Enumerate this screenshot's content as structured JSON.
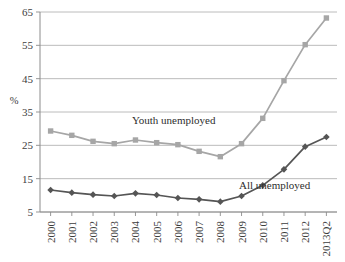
{
  "chart_data": {
    "type": "line",
    "title": "",
    "xlabel": "",
    "ylabel": "%",
    "ylim": [
      5,
      65
    ],
    "yticks": [
      5,
      15,
      25,
      35,
      45,
      55,
      65
    ],
    "grid": true,
    "legend_position": "inline-annotations",
    "categories": [
      "2000",
      "2001",
      "2002",
      "2003",
      "2004",
      "2005",
      "2006",
      "2007",
      "2008",
      "2009",
      "2010",
      "2011",
      "2012",
      "2013Q2"
    ],
    "series": [
      {
        "name": "Youth unemployed",
        "color": "#a6a6a6",
        "marker": "square",
        "values": [
          29.3,
          28.0,
          26.2,
          25.5,
          26.6,
          25.8,
          25.2,
          23.2,
          21.6,
          25.5,
          33.1,
          44.4,
          55.2,
          63.2
        ]
      },
      {
        "name": "All unemployed",
        "color": "#555555",
        "marker": "diamond",
        "values": [
          11.6,
          10.8,
          10.2,
          9.8,
          10.6,
          10.1,
          9.2,
          8.8,
          8.1,
          9.8,
          13.0,
          17.8,
          24.6,
          27.5
        ]
      }
    ],
    "annotations": [
      {
        "text": "Youth unemployed",
        "x_frac": 0.45,
        "y_value": 31.5
      },
      {
        "text": "All unemployed",
        "x_frac": 0.79,
        "y_value": 12.0
      }
    ]
  }
}
